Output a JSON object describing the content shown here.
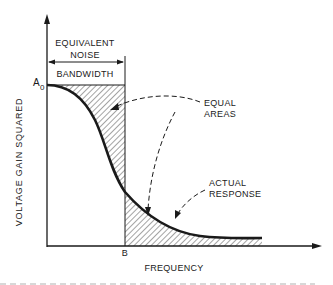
{
  "diagram": {
    "type": "noise-bandwidth-illustration",
    "y_axis_label": "VOLTAGE GAIN SQUARED",
    "x_axis_label": "FREQUENCY",
    "top_label_line1": "EQUIVALENT",
    "top_label_line2": "NOISE",
    "top_label_line3": "BANDWIDTH",
    "a0_label_main": "A",
    "a0_label_sub": "0",
    "b_label": "B",
    "callout_equal_areas_line1": "EQUAL",
    "callout_equal_areas_line2": "AREAS",
    "callout_actual_response_line1": "ACTUAL",
    "callout_actual_response_line2": "RESPONSE",
    "colors": {
      "ink": "#1a1a1a",
      "background": "#ffffff"
    }
  }
}
